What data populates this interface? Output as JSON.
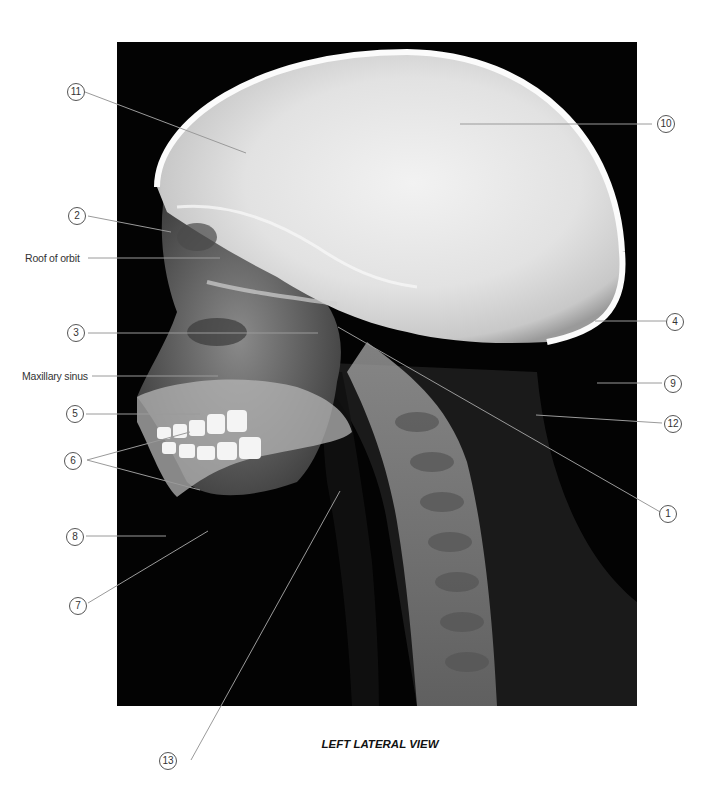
{
  "figure": {
    "caption": "LEFT LATERAL VIEW",
    "image_description": "Lateral radiograph of skull and cervical spine (child)",
    "text_labels": [
      {
        "id": "roof_of_orbit",
        "text": "Roof of orbit"
      },
      {
        "id": "maxillary_sinus",
        "text": "Maxillary sinus"
      }
    ],
    "numbered_callouts": [
      {
        "number": "1"
      },
      {
        "number": "2"
      },
      {
        "number": "3"
      },
      {
        "number": "4"
      },
      {
        "number": "5"
      },
      {
        "number": "6"
      },
      {
        "number": "7"
      },
      {
        "number": "8"
      },
      {
        "number": "9"
      },
      {
        "number": "10"
      },
      {
        "number": "11"
      },
      {
        "number": "12"
      },
      {
        "number": "13"
      }
    ],
    "colors": {
      "background": "#ffffff",
      "xray_background": "#030303",
      "leader_line": "#9a9a9a",
      "label_text": "#333333"
    }
  }
}
